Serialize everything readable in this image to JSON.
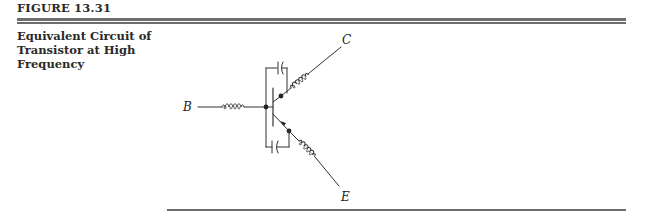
{
  "figure": {
    "label": "FIGURE 13.31",
    "caption_lines": [
      "Equivalent Circuit of",
      "Transistor at High",
      "Frequency"
    ]
  },
  "diagram": {
    "type": "circuit-schematic",
    "title": "Equivalent Circuit of Transistor at High Frequency",
    "terminals": {
      "base": "B",
      "collector": "C",
      "emitter": "E"
    },
    "components": [
      {
        "name": "base-lead-inductance",
        "kind": "inductor",
        "between": [
          "B",
          "base-node"
        ]
      },
      {
        "name": "collector-lead-inductance",
        "kind": "inductor",
        "between": [
          "collector-node",
          "C"
        ]
      },
      {
        "name": "emitter-lead-inductance",
        "kind": "inductor",
        "between": [
          "emitter-node",
          "E"
        ]
      },
      {
        "name": "base-collector-capacitance",
        "kind": "capacitor",
        "between": [
          "base-node",
          "collector-node"
        ]
      },
      {
        "name": "base-emitter-capacitance",
        "kind": "capacitor",
        "between": [
          "base-node",
          "emitter-node"
        ]
      },
      {
        "name": "transistor",
        "kind": "npn-bjt"
      }
    ],
    "colors": {
      "stroke": "#333333",
      "rule": "#6d6d6d"
    }
  }
}
